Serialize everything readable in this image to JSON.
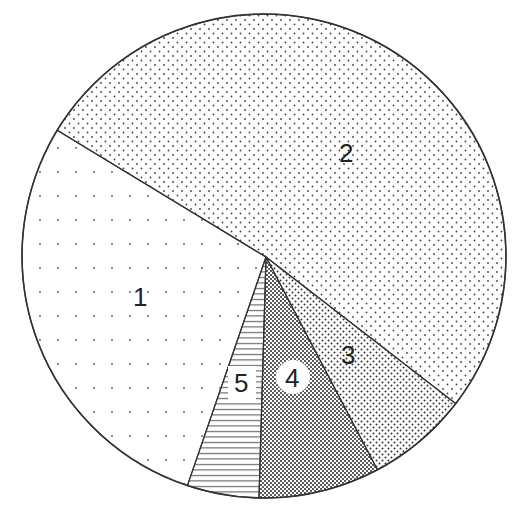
{
  "chart_data": {
    "type": "pie",
    "title": "",
    "start_angle_deg": 301.3,
    "direction": "clockwise",
    "slices": [
      {
        "label": "2",
        "value": 51.8,
        "pattern": "fine-dots"
      },
      {
        "label": "3",
        "value": 6.8,
        "pattern": "medium-dots"
      },
      {
        "label": "4",
        "value": 8.1,
        "pattern": "dense-dots"
      },
      {
        "label": "5",
        "value": 4.8,
        "pattern": "horizontal-lines"
      },
      {
        "label": "1",
        "value": 28.6,
        "pattern": "sparse-dotted-rows"
      }
    ],
    "categories": [
      "1",
      "2",
      "3",
      "4",
      "5"
    ],
    "values": [
      28.6,
      51.8,
      6.8,
      8.1,
      4.8
    ],
    "value_units": "percent (estimated from slice angles; no numeric labels shown)",
    "legend": "none",
    "colors": {
      "outline": "#333333",
      "background": "#ffffff",
      "ink": "#222222"
    }
  },
  "labels": {
    "s1": "1",
    "s2": "2",
    "s3": "3",
    "s4": "4",
    "s5": "5"
  }
}
